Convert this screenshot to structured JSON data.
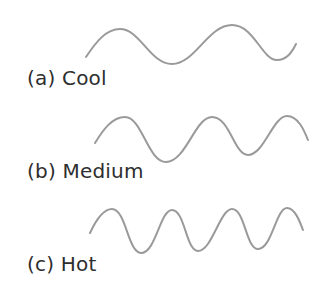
{
  "colors": {
    "wave_stroke": "#9a9a9a",
    "label_text": "#2e2e2e",
    "background": "#ffffff"
  },
  "waves": [
    {
      "id": "a",
      "label": "(a) Cool",
      "cycles": 2,
      "description": "long wavelength, low frequency"
    },
    {
      "id": "b",
      "label": "(b) Medium",
      "cycles": 2.5,
      "description": "medium wavelength, medium frequency"
    },
    {
      "id": "c",
      "label": "(c) Hot",
      "cycles": 3.8,
      "description": "short wavelength, high frequency"
    }
  ]
}
